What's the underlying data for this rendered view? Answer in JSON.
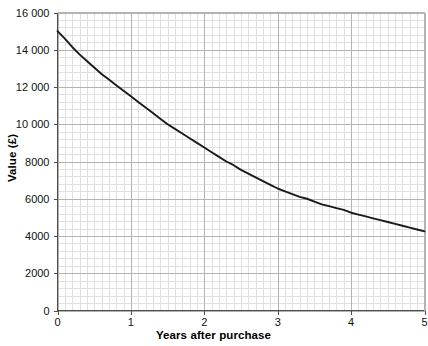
{
  "chart_data": {
    "type": "line",
    "title": "",
    "xlabel": "Years after purchase",
    "ylabel": "Value (£)",
    "xlim": [
      0,
      5
    ],
    "ylim": [
      0,
      16000
    ],
    "grid": true,
    "legend": "none",
    "x_ticks": [
      0,
      1,
      2,
      3,
      4,
      5
    ],
    "x_tick_labels": [
      "0",
      "1",
      "2",
      "3",
      "4",
      "5"
    ],
    "y_ticks": [
      0,
      2000,
      4000,
      6000,
      8000,
      10000,
      12000,
      14000,
      16000
    ],
    "y_tick_labels": [
      "0",
      "2000",
      "4000",
      "6000",
      "8000",
      "10 000",
      "12 000",
      "14 000",
      "16 000"
    ],
    "x_minor_step": 0.1,
    "y_minor_step": 400,
    "series": [
      {
        "name": "Value of car",
        "color": "#1a1a1a",
        "x": [
          0,
          0.1,
          0.2,
          0.3,
          0.4,
          0.5,
          0.6,
          0.7,
          0.8,
          0.9,
          1,
          1.1,
          1.2,
          1.3,
          1.4,
          1.5,
          1.6,
          1.7,
          1.8,
          1.9,
          2,
          2.1,
          2.2,
          2.3,
          2.4,
          2.5,
          2.6,
          2.7,
          2.8,
          2.9,
          3,
          3.1,
          3.2,
          3.3,
          3.4,
          3.5,
          3.6,
          3.7,
          3.8,
          3.9,
          4,
          4.1,
          4.2,
          4.3,
          4.4,
          4.5,
          4.6,
          4.7,
          4.8,
          4.9,
          5
        ],
        "y": [
          15000,
          14600,
          14150,
          13750,
          13400,
          13050,
          12700,
          12400,
          12100,
          11800,
          11500,
          11200,
          10900,
          10600,
          10300,
          10000,
          9750,
          9500,
          9250,
          9000,
          8750,
          8500,
          8250,
          8000,
          7800,
          7550,
          7350,
          7150,
          6950,
          6750,
          6550,
          6400,
          6250,
          6100,
          6000,
          5850,
          5700,
          5600,
          5500,
          5400,
          5250,
          5150,
          5050,
          4950,
          4850,
          4750,
          4650,
          4550,
          4450,
          4350,
          4250
        ]
      }
    ],
    "annotations": []
  },
  "axes": {
    "x_title": "Years after purchase",
    "y_title": "Value (£)"
  },
  "colors": {
    "curve": "#1a1a1a",
    "axis": "#4d4d4d",
    "major_grid": "#b3b3b3",
    "minor_grid": "#e0e0e0",
    "background": "#ffffff"
  }
}
